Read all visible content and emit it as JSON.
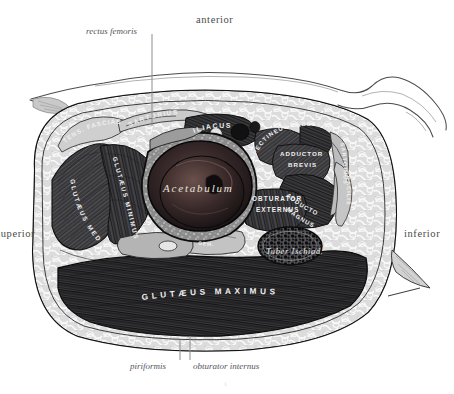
{
  "plate": {
    "title": "Transverse section of the hip through the acetabulum",
    "page_mark": "1",
    "background": "#ffffff",
    "ink": "#2b2b2b"
  },
  "orientation": {
    "anterior": "anterior",
    "posterior": "",
    "superior": "superior",
    "inferior": "inferior"
  },
  "callouts": [
    {
      "label": "rectus femoris",
      "x": 86,
      "y": 26
    },
    {
      "label": "piriformis",
      "x": 130,
      "y": 363
    },
    {
      "label": "obturator internus",
      "x": 193,
      "y": 363
    }
  ],
  "structures": {
    "acetabulum": "Acetabulum",
    "tuber_ischiadicum": "Tuber Ischiad.",
    "gluteus_maximus": "GLUTÆUS MAXIMUS",
    "gluteus_medius": "GLUTÆUS MEDIUS",
    "gluteus_minimus": "GLUTÆUS MINIMUS",
    "tensor_fasciae": "TENS. FASCIAE",
    "sartorius_top": "SARTORIUS",
    "iliacus": "ILIACUS",
    "pectineus": "PECTINEUS",
    "adductor_longus": "ADD. LONG.",
    "adductor_brevis_1": "ADDUCTOR",
    "adductor_brevis_2": "BREVIS",
    "adductor_magnus_1": "ADDUCTOR",
    "adductor_magnus_2": "MAGNUS",
    "sartorius_right": "SARTORIUS",
    "gracilis": "GRACILIS",
    "obturator_externus_1": "OBTURATOR",
    "obturator_externus_2": "EXTERNUS",
    "gemellus": "GEM."
  },
  "colors": {
    "outline": "#1c1c1c",
    "muscle_dark": "#3a3a3a",
    "muscle_mid": "#5a5a5a",
    "fat": "#d8d8d8",
    "bone": "#6e6e6e",
    "label_light": "#f2f2f2",
    "leader": "#8d8d93"
  }
}
